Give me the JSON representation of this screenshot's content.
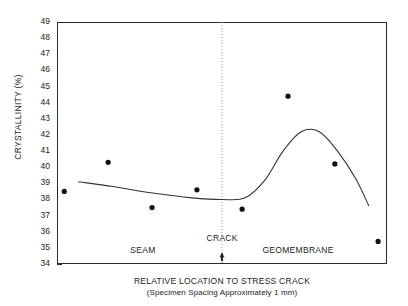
{
  "chart_data": {
    "type": "scatter",
    "title": "",
    "xlabel": "RELATIVE LOCATION TO STRESS CRACK",
    "xlabel_sub": "(Specimen Spacing Approximately 1 mm)",
    "ylabel": "CRYSTALLINITY (%)",
    "ylim": [
      34,
      49
    ],
    "ytick_labels": [
      "49",
      "48",
      "47",
      "46",
      "45",
      "44",
      "43",
      "42",
      "41",
      "40",
      "39",
      "38",
      "37",
      "36",
      "35",
      "34"
    ],
    "yticks": [
      49,
      48,
      47,
      46,
      45,
      44,
      43,
      42,
      41,
      40,
      39,
      38,
      37,
      36,
      35,
      34
    ],
    "xlim": [
      0,
      10
    ],
    "xtick_labels": [],
    "grid": false,
    "legend": null,
    "series": [
      {
        "name": "Crystallinity measurements",
        "marker": "filled-circle",
        "color": "#111111",
        "points": [
          {
            "x": 0.22,
            "y": 38.5
          },
          {
            "x": 1.55,
            "y": 40.3
          },
          {
            "x": 2.88,
            "y": 37.5
          },
          {
            "x": 4.24,
            "y": 38.6
          },
          {
            "x": 5.61,
            "y": 37.4
          },
          {
            "x": 7.0,
            "y": 44.4
          },
          {
            "x": 8.42,
            "y": 40.2
          },
          {
            "x": 9.73,
            "y": 35.4
          }
        ]
      },
      {
        "name": "Fitted trend curve",
        "marker": "none",
        "color": "#333333",
        "points": [
          {
            "x": 0.64,
            "y": 39.1
          },
          {
            "x": 1.7,
            "y": 38.8
          },
          {
            "x": 2.9,
            "y": 38.4
          },
          {
            "x": 4.1,
            "y": 38.1
          },
          {
            "x": 5.0,
            "y": 38.0
          },
          {
            "x": 5.7,
            "y": 38.1
          },
          {
            "x": 6.3,
            "y": 39.2
          },
          {
            "x": 6.85,
            "y": 41.0
          },
          {
            "x": 7.4,
            "y": 42.2
          },
          {
            "x": 7.95,
            "y": 42.2
          },
          {
            "x": 8.5,
            "y": 41.0
          },
          {
            "x": 9.05,
            "y": 39.3
          },
          {
            "x": 9.45,
            "y": 37.6
          }
        ]
      }
    ],
    "annotations": [
      {
        "name": "seam-label",
        "text": "SEAM",
        "x": 2.6,
        "y": 34.9
      },
      {
        "name": "crack-label",
        "text": "CRACK",
        "x": 5.0,
        "y": 35.6
      },
      {
        "name": "geomembrane-label",
        "text": "GEOMEMBRANE",
        "x": 7.3,
        "y": 34.9
      },
      {
        "name": "crack-vertical-line",
        "text": "",
        "x": 5.0,
        "y": 0
      }
    ]
  },
  "axis": {
    "y_title": "CRYSTALLINITY (%)",
    "x_title": "RELATIVE LOCATION TO STRESS CRACK",
    "x_subtitle": "(Specimen Spacing Approximately 1 mm)"
  },
  "labels": {
    "seam": "SEAM",
    "crack": "CRACK",
    "geomembrane": "GEOMEMBRANE"
  },
  "colors": {
    "axis": "#2b2b2b",
    "marker": "#111111",
    "curve": "#333333",
    "crack_line": "#999999",
    "background": "#ffffff"
  }
}
